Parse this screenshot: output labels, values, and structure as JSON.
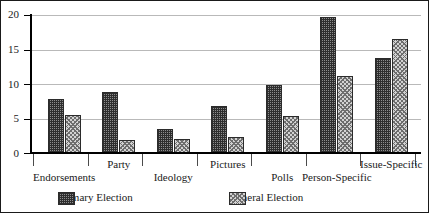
{
  "chart_data": {
    "type": "bar",
    "title": "",
    "xlabel": "",
    "ylabel": "",
    "ylim": [
      0,
      20
    ],
    "yticks": [
      "0",
      "5",
      "10",
      "15",
      "20"
    ],
    "grid": true,
    "legend_position": "bottom",
    "categories": [
      "Endorsements",
      "Party",
      "Ideology",
      "Pictures",
      "Polls",
      "Person-Specific",
      "Issue-Specific"
    ],
    "series": [
      {
        "name": "Primary Election",
        "pattern": "crosshatch-dark",
        "values": [
          7.8,
          8.8,
          3.5,
          6.8,
          9.8,
          19.7,
          13.7
        ]
      },
      {
        "name": "General Election",
        "pattern": "dotted-light",
        "values": [
          5.5,
          1.9,
          2.0,
          2.3,
          5.4,
          11.2,
          16.5
        ]
      }
    ]
  },
  "legend": {
    "entries": [
      {
        "label": "Primary Election"
      },
      {
        "label": "General Election"
      }
    ]
  }
}
